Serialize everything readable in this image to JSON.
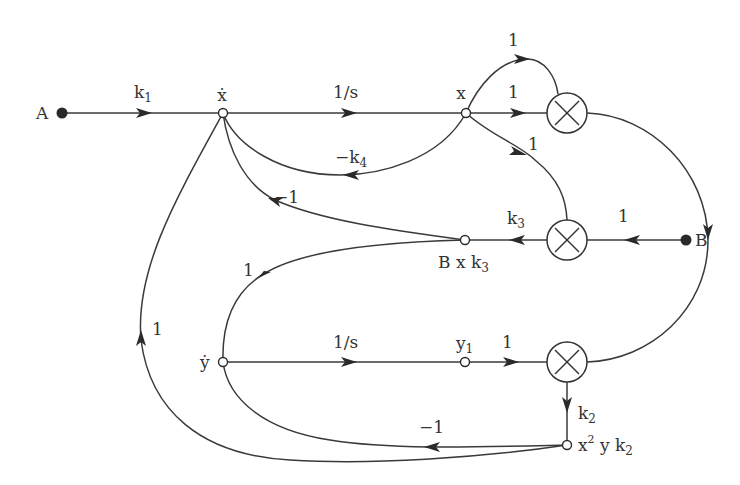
{
  "diagram": {
    "type": "signal-flow-graph",
    "nodes": {
      "A": {
        "label": "A",
        "kind": "source"
      },
      "B": {
        "label": "B",
        "kind": "source"
      },
      "x_dot": {
        "label": "ẋ",
        "kind": "node"
      },
      "x": {
        "label": "x",
        "kind": "node"
      },
      "Bxk3": {
        "label": "B x k",
        "sub": "3",
        "kind": "node"
      },
      "y_dot": {
        "label": "ẏ",
        "kind": "node"
      },
      "y1": {
        "label": "y",
        "sub": "1",
        "kind": "node"
      },
      "x2yk2": {
        "label": "x",
        "sup": "2",
        "mid": " y k",
        "sub": "2",
        "kind": "node"
      },
      "mult_top": {
        "label": "×",
        "kind": "multiplier"
      },
      "mult_mid": {
        "label": "×",
        "kind": "multiplier"
      },
      "mult_bot": {
        "label": "×",
        "kind": "multiplier"
      }
    },
    "edges": [
      {
        "from": "A",
        "to": "x_dot",
        "gain": "k",
        "gain_sub": "1"
      },
      {
        "from": "x_dot",
        "to": "x",
        "gain": "1/s"
      },
      {
        "from": "x",
        "to": "mult_top",
        "gain": "1",
        "route": "upper-arc"
      },
      {
        "from": "x",
        "to": "mult_top",
        "gain": "1",
        "route": "straight"
      },
      {
        "from": "x",
        "to": "mult_mid",
        "gain": "1"
      },
      {
        "from": "x",
        "to": "x_dot",
        "gain": "−k",
        "gain_sub": "4"
      },
      {
        "from": "B",
        "to": "mult_mid",
        "gain": "1"
      },
      {
        "from": "mult_mid",
        "to": "Bxk3",
        "gain": "k",
        "gain_sub": "3"
      },
      {
        "from": "Bxk3",
        "to": "x_dot",
        "gain": "−1"
      },
      {
        "from": "Bxk3",
        "to": "y_dot",
        "gain": "1"
      },
      {
        "from": "y_dot",
        "to": "y1",
        "gain": "1/s"
      },
      {
        "from": "y1",
        "to": "mult_bot",
        "gain": "1"
      },
      {
        "from": "mult_top",
        "to": "mult_bot",
        "gain": "",
        "route": "right-arc"
      },
      {
        "from": "mult_bot",
        "to": "x2yk2",
        "gain": "k",
        "gain_sub": "2"
      },
      {
        "from": "x2yk2",
        "to": "y_dot",
        "gain": "−1"
      },
      {
        "from": "x2yk2",
        "to": "x_dot",
        "gain": "1"
      }
    ]
  }
}
